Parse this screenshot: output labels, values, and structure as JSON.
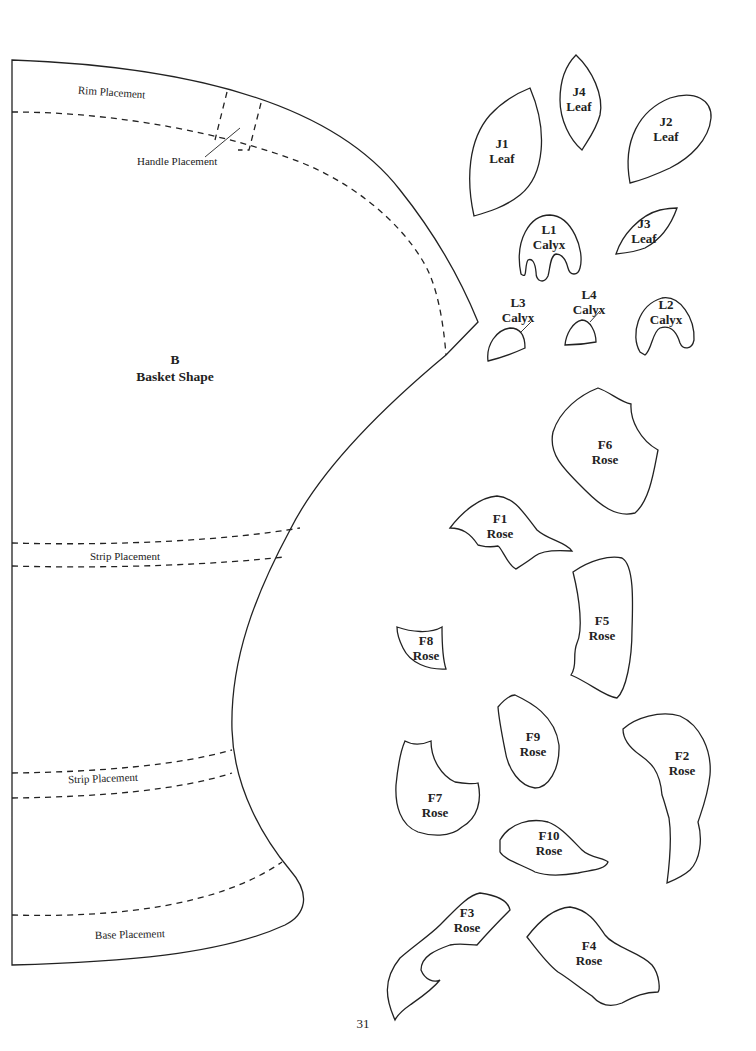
{
  "basket": {
    "piece_id": "B",
    "piece_name": "Basket Shape",
    "guides": {
      "rim": "Rim Placement",
      "handle": "Handle Placement",
      "strip_upper": "Strip Placement",
      "strip_lower": "Strip Placement",
      "base": "Base Placement"
    }
  },
  "pieces": [
    {
      "id": "J1",
      "name": "Leaf"
    },
    {
      "id": "J4",
      "name": "Leaf"
    },
    {
      "id": "J2",
      "name": "Leaf"
    },
    {
      "id": "J3",
      "name": "Leaf"
    },
    {
      "id": "L1",
      "name": "Calyx"
    },
    {
      "id": "L3",
      "name": "Calyx"
    },
    {
      "id": "L4",
      "name": "Calyx"
    },
    {
      "id": "L2",
      "name": "Calyx"
    },
    {
      "id": "F6",
      "name": "Rose"
    },
    {
      "id": "F1",
      "name": "Rose"
    },
    {
      "id": "F5",
      "name": "Rose"
    },
    {
      "id": "F8",
      "name": "Rose"
    },
    {
      "id": "F9",
      "name": "Rose"
    },
    {
      "id": "F2",
      "name": "Rose"
    },
    {
      "id": "F7",
      "name": "Rose"
    },
    {
      "id": "F10",
      "name": "Rose"
    },
    {
      "id": "F3",
      "name": "Rose"
    },
    {
      "id": "F4",
      "name": "Rose"
    }
  ],
  "footer": {
    "page_number": "31"
  }
}
